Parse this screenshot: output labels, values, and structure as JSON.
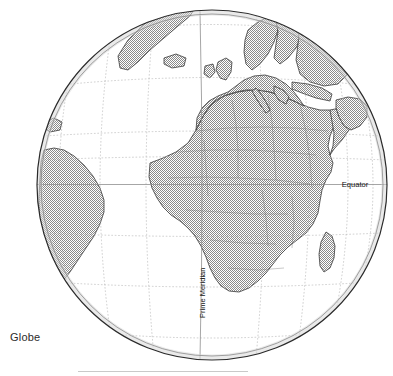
{
  "figure": {
    "caption": "Globe",
    "type": "orthographic-globe-map"
  },
  "map": {
    "projection": "orthographic",
    "center": {
      "lon": 10,
      "lat": 10
    },
    "circle": {
      "cx": 212,
      "cy": 185,
      "r": 175
    },
    "labels": {
      "equator": "Equator",
      "prime_meridian": "Prime Meridian"
    },
    "graticule": {
      "interval_degrees": 15,
      "style": "dotted",
      "color": "#b9b9b9"
    },
    "colors": {
      "land_fill": "#8e8e8e",
      "ocean_fill": "#ffffff",
      "outline": "#2a2a2a",
      "coastline": "#3a3a3a",
      "border": "#6e6e6e",
      "graticule": "#b9b9b9",
      "label_text": "#1b1b1b",
      "caption_text": "#2b2b2b",
      "rule": "#c9c9c9"
    },
    "visible_regions": [
      "Africa",
      "Europe",
      "Mediterranean Sea",
      "Scandinavia",
      "Greenland",
      "Iceland",
      "British Isles",
      "Madagascar",
      "Arabian Peninsula",
      "South America (east coast)",
      "Antarctica (south limb)",
      "Atlantic Ocean",
      "Indian Ocean"
    ]
  },
  "rule": {
    "x": 78,
    "y": 371,
    "width": 170
  }
}
